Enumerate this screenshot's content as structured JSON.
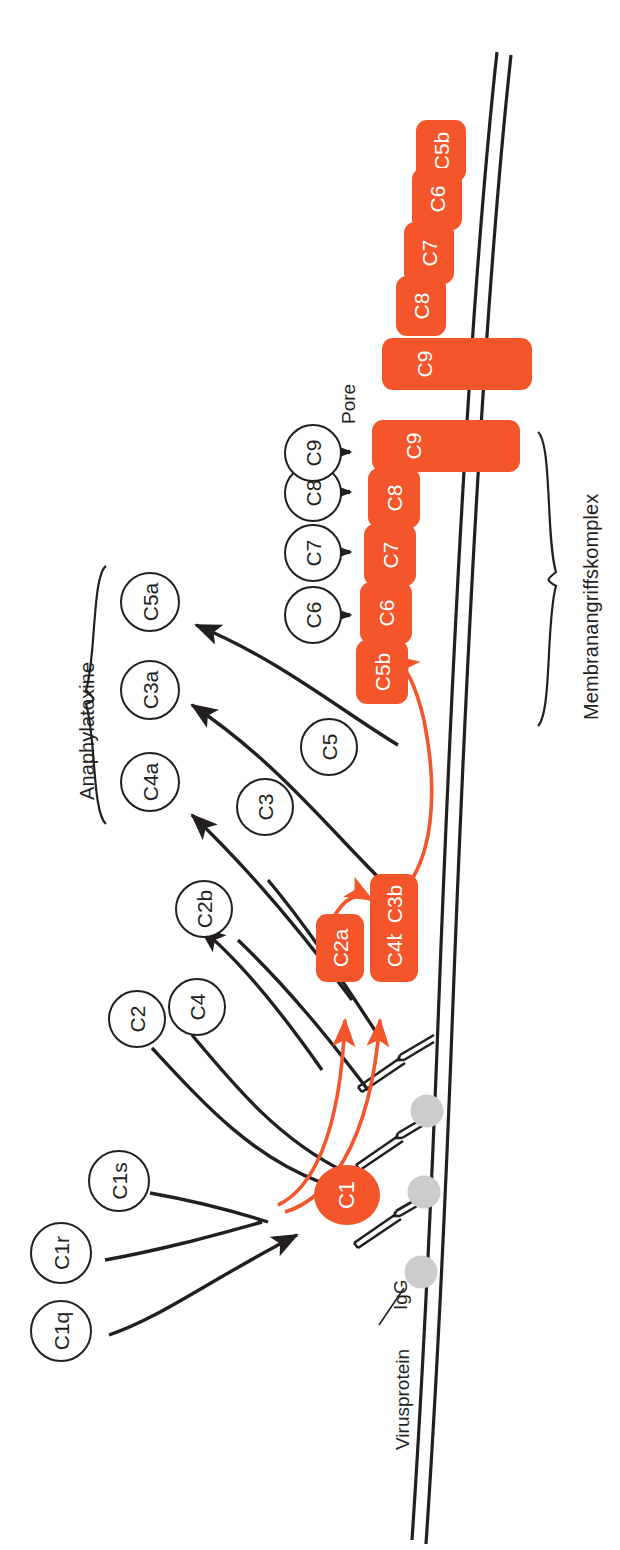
{
  "figure": {
    "orientation": "rotated-90-ccw",
    "colors": {
      "orange": "#F4552A",
      "black": "#231f20",
      "gray": "#CCCCCC",
      "white": "#FFFFFF"
    }
  },
  "group_labels": {
    "anaphylatoxine": "Anaphylatoxine",
    "membranangriffskomplex": "Membranangriffskomplex",
    "pore": "Pore"
  },
  "annotations": {
    "virusprotein": "Virusprotein",
    "igg": "IgG"
  },
  "initiation_circles": [
    {
      "id": "c1q",
      "label": "C1q"
    },
    {
      "id": "c1r",
      "label": "C1r"
    },
    {
      "id": "c1s",
      "label": "C1s"
    }
  ],
  "bound_c1": {
    "label": "C1"
  },
  "substrate_circles": [
    {
      "id": "c2",
      "label": "C2"
    },
    {
      "id": "c4",
      "label": "C4"
    },
    {
      "id": "c3",
      "label": "C3"
    },
    {
      "id": "c5",
      "label": "C5"
    }
  ],
  "terminal_circles": [
    {
      "id": "c6",
      "label": "C6"
    },
    {
      "id": "c7",
      "label": "C7"
    },
    {
      "id": "c8",
      "label": "C8"
    },
    {
      "id": "c9",
      "label": "C9"
    }
  ],
  "released_fragments": [
    {
      "id": "c2b",
      "label": "C2b",
      "group": "none"
    },
    {
      "id": "c4a",
      "label": "C4a",
      "group": "anaphylatoxine"
    },
    {
      "id": "c3a",
      "label": "C3a",
      "group": "anaphylatoxine"
    },
    {
      "id": "c5a",
      "label": "C5a",
      "group": "anaphylatoxine"
    }
  ],
  "convertase_blocks": [
    {
      "id": "c2a",
      "label": "C2a"
    },
    {
      "id": "c4b",
      "label": "C4b"
    },
    {
      "id": "c3b",
      "label": "C3b"
    }
  ],
  "mac_blocks": [
    {
      "id": "mac-c5b",
      "label": "C5b"
    },
    {
      "id": "mac-c6",
      "label": "C6"
    },
    {
      "id": "mac-c7",
      "label": "C7"
    },
    {
      "id": "mac-c8",
      "label": "C8"
    },
    {
      "id": "mac-c9",
      "label": "C9"
    }
  ],
  "pore_blocks": [
    {
      "id": "pore-c5b",
      "label": "C5b"
    },
    {
      "id": "pore-c6",
      "label": "C6"
    },
    {
      "id": "pore-c7",
      "label": "C7"
    },
    {
      "id": "pore-c8",
      "label": "C8"
    },
    {
      "id": "pore-c9",
      "label": "C9"
    }
  ]
}
